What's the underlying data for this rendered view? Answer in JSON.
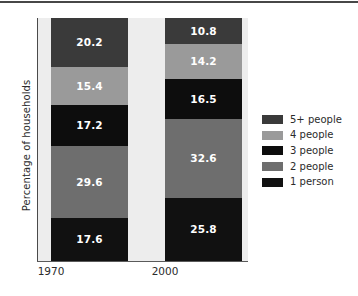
{
  "chart_data": {
    "type": "bar",
    "subtype": "stacked-bar-100",
    "title": "",
    "xlabel": "",
    "ylabel": "Percentage of households",
    "categories": [
      "1970",
      "2000"
    ],
    "ylim": [
      0,
      100
    ],
    "grid": false,
    "legend_position": "right",
    "stack_order_bottom_to_top": [
      "1 person",
      "2 people",
      "3 people",
      "4 people",
      "5+ people"
    ],
    "series": [
      {
        "name": "1 person",
        "color": "#111111",
        "values": [
          17.6,
          25.8
        ],
        "labels": [
          "17.6",
          "25.8"
        ]
      },
      {
        "name": "2 people",
        "color": "#6e6e6e",
        "values": [
          29.6,
          32.6
        ],
        "labels": [
          "29.6",
          "32.6"
        ]
      },
      {
        "name": "3 people",
        "color": "#0d0d0d",
        "values": [
          17.2,
          16.5
        ],
        "labels": [
          "17.2",
          "16.5"
        ]
      },
      {
        "name": "4 people",
        "color": "#9a9a9a",
        "values": [
          15.4,
          14.2
        ],
        "labels": [
          "15.4",
          "14.2"
        ]
      },
      {
        "name": "5+ people",
        "color": "#3a3a3a",
        "values": [
          20.2,
          10.8
        ],
        "labels": [
          "20.2",
          "10.8"
        ]
      }
    ],
    "legend_entries_top_to_bottom": [
      {
        "label": "5+ people",
        "color": "#3a3a3a"
      },
      {
        "label": "4 people",
        "color": "#9a9a9a"
      },
      {
        "label": "3 people",
        "color": "#0d0d0d"
      },
      {
        "label": "2 people",
        "color": "#6e6e6e"
      },
      {
        "label": "1 person",
        "color": "#111111"
      }
    ]
  },
  "axis": {
    "y_title": "Percentage of households",
    "x_ticks": [
      "1970",
      "2000"
    ]
  },
  "bars": {
    "b1970": {
      "category": "1970",
      "segments": [
        {
          "name": "1 person",
          "value": "17.6",
          "color": "#111111"
        },
        {
          "name": "2 people",
          "value": "29.6",
          "color": "#6e6e6e"
        },
        {
          "name": "3 people",
          "value": "17.2",
          "color": "#0d0d0d"
        },
        {
          "name": "4 people",
          "value": "15.4",
          "color": "#9a9a9a"
        },
        {
          "name": "5+ people",
          "value": "20.2",
          "color": "#3a3a3a"
        }
      ]
    },
    "b2000": {
      "category": "2000",
      "segments": [
        {
          "name": "1 person",
          "value": "25.8",
          "color": "#111111"
        },
        {
          "name": "2 people",
          "value": "32.6",
          "color": "#6e6e6e"
        },
        {
          "name": "3 people",
          "value": "16.5",
          "color": "#0d0d0d"
        },
        {
          "name": "4 people",
          "value": "14.2",
          "color": "#9a9a9a"
        },
        {
          "name": "5+ people",
          "value": "10.8",
          "color": "#3a3a3a"
        }
      ]
    }
  },
  "legend": {
    "items": [
      {
        "label": "5+ people",
        "color": "#3a3a3a"
      },
      {
        "label": "4 people",
        "color": "#9a9a9a"
      },
      {
        "label": "3 people",
        "color": "#0d0d0d"
      },
      {
        "label": "2 people",
        "color": "#6e6e6e"
      },
      {
        "label": "1 person",
        "color": "#111111"
      }
    ]
  },
  "colors": {
    "panel_background": "#ededed",
    "page_background": "#ffffff",
    "axis_line": "#4a4a4a",
    "top_rule": "#474747",
    "label_text": "#2b2b2b",
    "value_text": "#ffffff"
  }
}
